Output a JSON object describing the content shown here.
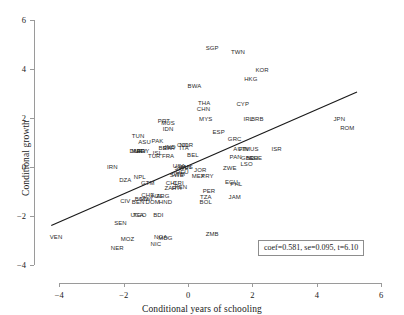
{
  "chart_data": {
    "type": "scatter",
    "title": "",
    "xlabel": "Conditional years of schooling",
    "ylabel": "Conditional growth",
    "xlim": [
      -4.6,
      6.4
    ],
    "ylim": [
      -4.5,
      6.4
    ],
    "xticks": [
      -4,
      -2,
      0,
      2,
      4,
      6
    ],
    "xticklabels": [
      "−4",
      "−2",
      "0",
      "2",
      "4",
      "6"
    ],
    "yticks": [
      -4,
      -2,
      0,
      2,
      4,
      6
    ],
    "yticklabels": [
      "−4",
      "−2",
      "0",
      "2",
      "4",
      "6"
    ],
    "grid": false,
    "legend_position": "lower-right",
    "marker_style": "text-label",
    "fit_line": {
      "type": "linear-regression",
      "slope": 0.581,
      "x_start": -4.25,
      "y_start": -2.4,
      "x_end": 5.25,
      "y_end": 3.05,
      "color": "#1a1a1a"
    },
    "annotation": {
      "coef_label": "coef",
      "coef_value": "0.581",
      "se_label": "se",
      "se_value": "0.095",
      "t_label": "t",
      "t_value": "6.10",
      "text": "coef=0.581, se=0.095, t=6.10"
    },
    "points": [
      {
        "label": "SGP",
        "x": 0.75,
        "y": 4.85
      },
      {
        "label": "TWN",
        "x": 1.55,
        "y": 4.7
      },
      {
        "label": "KOR",
        "x": 2.3,
        "y": 3.95
      },
      {
        "label": "HKG",
        "x": 1.95,
        "y": 3.6
      },
      {
        "label": "BWA",
        "x": 0.2,
        "y": 3.3
      },
      {
        "label": "THA",
        "x": 0.5,
        "y": 2.6
      },
      {
        "label": "CYP",
        "x": 1.7,
        "y": 2.55
      },
      {
        "label": "CHN",
        "x": 0.48,
        "y": 2.35
      },
      {
        "label": "MYS",
        "x": 0.55,
        "y": 1.95
      },
      {
        "label": "IRL",
        "x": 1.87,
        "y": 1.95
      },
      {
        "label": "BRB",
        "x": 2.15,
        "y": 1.95
      },
      {
        "label": "JPN",
        "x": 4.7,
        "y": 1.95
      },
      {
        "label": "PRT",
        "x": -0.75,
        "y": 1.85
      },
      {
        "label": "MUS",
        "x": -0.62,
        "y": 1.78
      },
      {
        "label": "IDN",
        "x": -0.62,
        "y": 1.55
      },
      {
        "label": "ROM",
        "x": 4.95,
        "y": 1.6
      },
      {
        "label": "ESP",
        "x": 0.95,
        "y": 1.4
      },
      {
        "label": "TUN",
        "x": -1.55,
        "y": 1.25
      },
      {
        "label": "GRC",
        "x": 1.45,
        "y": 1.15
      },
      {
        "label": "PAK",
        "x": -0.95,
        "y": 1.05
      },
      {
        "label": "ASU",
        "x": -1.35,
        "y": 1.0
      },
      {
        "label": "COL",
        "x": -0.15,
        "y": 0.9
      },
      {
        "label": "NOR",
        "x": -0.05,
        "y": 0.88
      },
      {
        "label": "IND",
        "x": -0.55,
        "y": 0.8
      },
      {
        "label": "BRA",
        "x": -0.72,
        "y": 0.78
      },
      {
        "label": "SYR",
        "x": -0.6,
        "y": 0.78
      },
      {
        "label": "ITA",
        "x": -0.12,
        "y": 0.75
      },
      {
        "label": "AUT",
        "x": 1.6,
        "y": 0.72
      },
      {
        "label": "FIN",
        "x": 1.72,
        "y": 0.72
      },
      {
        "label": "MUS2",
        "x": 1.98,
        "y": 0.72
      },
      {
        "label": "ISR",
        "x": 2.75,
        "y": 0.72
      },
      {
        "label": "EGY",
        "x": -1.4,
        "y": 0.65
      },
      {
        "label": "MAR",
        "x": -1.55,
        "y": 0.65
      },
      {
        "label": "URY",
        "x": -1.48,
        "y": 0.65
      },
      {
        "label": "DNK",
        "x": -1.62,
        "y": 0.65
      },
      {
        "label": "ISL",
        "x": -0.95,
        "y": 0.55
      },
      {
        "label": "BEL",
        "x": 0.15,
        "y": 0.5
      },
      {
        "label": "FRA",
        "x": -0.62,
        "y": 0.45
      },
      {
        "label": "TUR",
        "x": -1.05,
        "y": 0.42
      },
      {
        "label": "PAN",
        "x": 1.48,
        "y": 0.38
      },
      {
        "label": "GBR",
        "x": 1.85,
        "y": 0.35
      },
      {
        "label": "NLD",
        "x": 2.0,
        "y": 0.35
      },
      {
        "label": "CHE",
        "x": 2.1,
        "y": 0.35
      },
      {
        "label": "LSO",
        "x": 1.82,
        "y": 0.1
      },
      {
        "label": "USA",
        "x": -0.28,
        "y": 0.02
      },
      {
        "label": "CAN",
        "x": -0.1,
        "y": 0.0
      },
      {
        "label": "AUS",
        "x": -0.05,
        "y": -0.02
      },
      {
        "label": "SWE",
        "x": -0.2,
        "y": -0.05
      },
      {
        "label": "IRN",
        "x": -2.35,
        "y": 0.0
      },
      {
        "label": "ZWE",
        "x": 1.3,
        "y": -0.05
      },
      {
        "label": "JOR",
        "x": 0.38,
        "y": -0.15
      },
      {
        "label": "DEU",
        "x": -0.18,
        "y": -0.22
      },
      {
        "label": "GTM2",
        "x": -0.3,
        "y": -0.3
      },
      {
        "label": "SWE2",
        "x": -0.35,
        "y": -0.35
      },
      {
        "label": "MEX",
        "x": 0.32,
        "y": -0.38
      },
      {
        "label": "PRY",
        "x": 0.6,
        "y": -0.38
      },
      {
        "label": "NPL",
        "x": -1.5,
        "y": -0.42
      },
      {
        "label": "DZA",
        "x": -1.95,
        "y": -0.52
      },
      {
        "label": "GTM",
        "x": -1.25,
        "y": -0.68
      },
      {
        "label": "CHL",
        "x": -0.5,
        "y": -0.65
      },
      {
        "label": "CRI",
        "x": -0.3,
        "y": -0.68
      },
      {
        "label": "ECU",
        "x": 1.35,
        "y": -0.62
      },
      {
        "label": "PHL",
        "x": 1.5,
        "y": -0.7
      },
      {
        "label": "ZAF",
        "x": -0.55,
        "y": -0.85
      },
      {
        "label": "HTI",
        "x": -0.35,
        "y": -0.88
      },
      {
        "label": "KEN",
        "x": -0.22,
        "y": -0.82
      },
      {
        "label": "PER",
        "x": 0.65,
        "y": -1.0
      },
      {
        "label": "CHE2",
        "x": -1.25,
        "y": -1.15
      },
      {
        "label": "NZL",
        "x": -0.95,
        "y": -1.2
      },
      {
        "label": "ARG",
        "x": -0.78,
        "y": -1.2
      },
      {
        "label": "TZA",
        "x": 0.55,
        "y": -1.25
      },
      {
        "label": "JAM",
        "x": 1.45,
        "y": -1.25
      },
      {
        "label": "BGD",
        "x": -1.45,
        "y": -1.3
      },
      {
        "label": "MWI",
        "x": -1.3,
        "y": -1.32
      },
      {
        "label": "CIV",
        "x": -1.95,
        "y": -1.4
      },
      {
        "label": "BEN",
        "x": -1.55,
        "y": -1.42
      },
      {
        "label": "DOM",
        "x": -1.1,
        "y": -1.42
      },
      {
        "label": "HND",
        "x": -0.7,
        "y": -1.45
      },
      {
        "label": "BOL",
        "x": 0.55,
        "y": -1.45
      },
      {
        "label": "TGO",
        "x": -1.5,
        "y": -1.95
      },
      {
        "label": "UGA",
        "x": -1.58,
        "y": -1.95
      },
      {
        "label": "BDI",
        "x": -0.92,
        "y": -1.98
      },
      {
        "label": "SEN",
        "x": -2.1,
        "y": -2.3
      },
      {
        "label": "VEN",
        "x": -4.1,
        "y": -2.85
      },
      {
        "label": "ZMB",
        "x": 0.75,
        "y": -2.75
      },
      {
        "label": "MOZ",
        "x": -1.88,
        "y": -2.95
      },
      {
        "label": "MDG",
        "x": -0.7,
        "y": -2.9
      },
      {
        "label": "NGA",
        "x": -0.85,
        "y": -2.88
      },
      {
        "label": "NIC",
        "x": -1.0,
        "y": -3.15
      },
      {
        "label": "NER",
        "x": -2.2,
        "y": -3.3
      }
    ]
  }
}
